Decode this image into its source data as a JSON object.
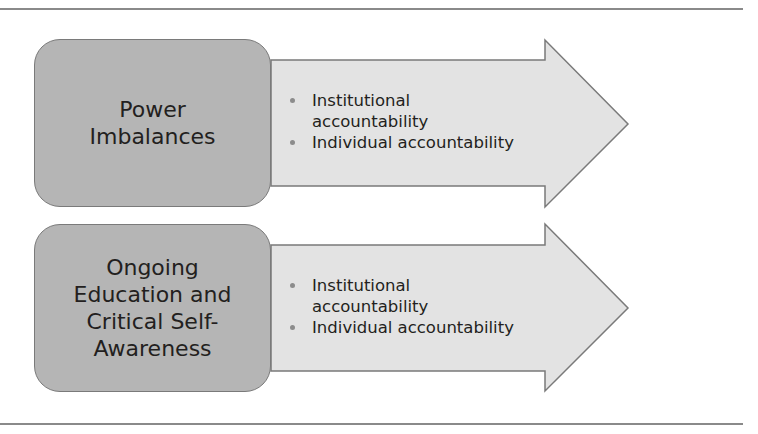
{
  "diagram": {
    "rows": [
      {
        "title_lines": [
          "Power",
          "Imbalances"
        ],
        "bullets": [
          [
            "Institutional",
            "accountability"
          ],
          [
            "Individual accountability"
          ]
        ]
      },
      {
        "title_lines": [
          "Ongoing",
          "Education and",
          "Critical Self-",
          "Awareness"
        ],
        "bullets": [
          [
            "Institutional",
            "accountability"
          ],
          [
            "Individual accountability"
          ]
        ]
      }
    ],
    "colors": {
      "box_fill": "#b5b5b5",
      "arrow_fill": "#e3e3e3",
      "outline": "#7a7a7a",
      "rule": "#8a8a8a"
    }
  }
}
